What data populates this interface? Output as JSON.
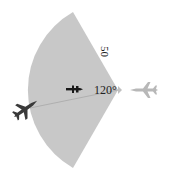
{
  "diagram": {
    "type": "radar-sector",
    "angle_label": "120°",
    "range_label": "50",
    "colors": {
      "sector_fill": "#c8c8c8",
      "player_jet": "#3a3a3a",
      "target_jet": "#b8b8b8",
      "missile": "#1a1a1a"
    },
    "elements": [
      {
        "name": "sector",
        "sweep_degrees": 120
      },
      {
        "name": "player-jet",
        "position": "left"
      },
      {
        "name": "missile",
        "position": "inside-sector"
      },
      {
        "name": "target-jet",
        "position": "right"
      }
    ]
  }
}
